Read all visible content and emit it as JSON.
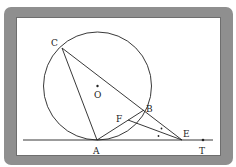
{
  "diagram": {
    "type": "circle-geometry",
    "circle": {
      "center_label": "O",
      "cx": 97.5,
      "cy": 86,
      "r": 54
    },
    "points": {
      "C": {
        "label": "C",
        "x": 62,
        "y": 48
      },
      "O": {
        "label": "O",
        "x": 97.5,
        "y": 86
      },
      "B": {
        "label": "B",
        "x": 144,
        "y": 110
      },
      "F": {
        "label": "F",
        "x": 128,
        "y": 120
      },
      "A": {
        "label": "A",
        "x": 97,
        "y": 140
      },
      "E": {
        "label": "E",
        "x": 182,
        "y": 140
      },
      "T": {
        "label": "T",
        "x": 203,
        "y": 140
      }
    },
    "segments": [
      "C-A",
      "C-E",
      "A-B",
      "F-E"
    ],
    "tangent_line": {
      "from_x": 23,
      "to_x": 213,
      "y": 140,
      "through": [
        "A",
        "E",
        "T"
      ]
    },
    "angle_marks": [
      "angle AEF (dot)",
      "angle FEB (dot)"
    ],
    "colors": {
      "frame": "#8f8f8f",
      "stroke": "#222222",
      "background": "#ffffff"
    }
  }
}
